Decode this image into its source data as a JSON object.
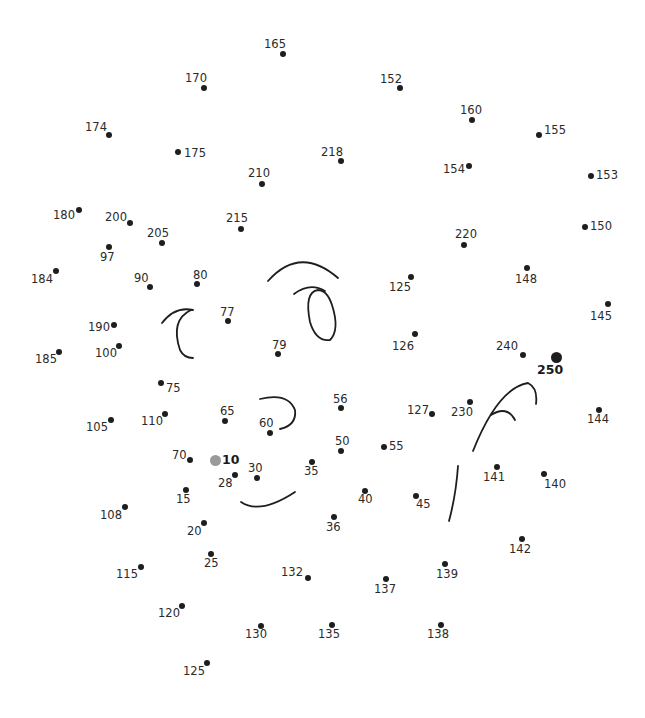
{
  "puzzle": {
    "type": "connect-the-dots",
    "start_number": "10",
    "end_number": "250",
    "colors": {
      "dot": "#1e1e1e",
      "start_dot": "#9a9a9a",
      "line": "#1e1e1e",
      "text": "#2a2a2a"
    },
    "dots": [
      {
        "n": "165",
        "x": 283,
        "y": 54,
        "lx": 264,
        "ly": 39
      },
      {
        "n": "170",
        "x": 204,
        "y": 88,
        "lx": 185,
        "ly": 73
      },
      {
        "n": "152",
        "x": 400,
        "y": 88,
        "lx": 380,
        "ly": 74
      },
      {
        "n": "160",
        "x": 472,
        "y": 120,
        "lx": 460,
        "ly": 105
      },
      {
        "n": "174",
        "x": 109,
        "y": 135,
        "lx": 85,
        "ly": 122
      },
      {
        "n": "155",
        "x": 539,
        "y": 135,
        "lx": 544,
        "ly": 125
      },
      {
        "n": "175",
        "x": 178,
        "y": 152,
        "lx": 184,
        "ly": 148
      },
      {
        "n": "218",
        "x": 341,
        "y": 161,
        "lx": 321,
        "ly": 147
      },
      {
        "n": "154",
        "x": 469,
        "y": 166,
        "lx": 443,
        "ly": 164
      },
      {
        "n": "153",
        "x": 591,
        "y": 176,
        "lx": 596,
        "ly": 170
      },
      {
        "n": "210",
        "x": 262,
        "y": 184,
        "lx": 248,
        "ly": 168
      },
      {
        "n": "180",
        "x": 79,
        "y": 210,
        "lx": 53,
        "ly": 210
      },
      {
        "n": "200",
        "x": 130,
        "y": 223,
        "lx": 105,
        "ly": 212
      },
      {
        "n": "215",
        "x": 241,
        "y": 229,
        "lx": 226,
        "ly": 213
      },
      {
        "n": "150",
        "x": 585,
        "y": 227,
        "lx": 590,
        "ly": 221
      },
      {
        "n": "205",
        "x": 162,
        "y": 243,
        "lx": 147,
        "ly": 228
      },
      {
        "n": "220",
        "x": 464,
        "y": 245,
        "lx": 455,
        "ly": 229
      },
      {
        "n": "97",
        "x": 109,
        "y": 247,
        "lx": 100,
        "ly": 252
      },
      {
        "n": "184",
        "x": 56,
        "y": 271,
        "lx": 31,
        "ly": 274
      },
      {
        "n": "125",
        "x": 411,
        "y": 277,
        "lx": 389,
        "ly": 282
      },
      {
        "n": "148",
        "x": 527,
        "y": 268,
        "lx": 515,
        "ly": 274
      },
      {
        "n": "90",
        "x": 150,
        "y": 287,
        "lx": 134,
        "ly": 273
      },
      {
        "n": "80",
        "x": 197,
        "y": 284,
        "lx": 193,
        "ly": 270
      },
      {
        "n": "145",
        "x": 608,
        "y": 304,
        "lx": 590,
        "ly": 311
      },
      {
        "n": "77",
        "x": 228,
        "y": 321,
        "lx": 220,
        "ly": 307
      },
      {
        "n": "190",
        "x": 114,
        "y": 325,
        "lx": 88,
        "ly": 322
      },
      {
        "n": "126",
        "x": 415,
        "y": 334,
        "lx": 392,
        "ly": 341
      },
      {
        "n": "100",
        "x": 119,
        "y": 346,
        "lx": 95,
        "ly": 348
      },
      {
        "n": "185",
        "x": 59,
        "y": 352,
        "lx": 35,
        "ly": 354
      },
      {
        "n": "79",
        "x": 278,
        "y": 354,
        "lx": 272,
        "ly": 340
      },
      {
        "n": "240",
        "x": 523,
        "y": 355,
        "lx": 496,
        "ly": 341
      },
      {
        "n": "250",
        "x": 556,
        "y": 357,
        "lx": 537,
        "ly": 364,
        "big": true
      },
      {
        "n": "75",
        "x": 161,
        "y": 383,
        "lx": 166,
        "ly": 383
      },
      {
        "n": "56",
        "x": 341,
        "y": 408,
        "lx": 333,
        "ly": 394
      },
      {
        "n": "127",
        "x": 432,
        "y": 414,
        "lx": 407,
        "ly": 405
      },
      {
        "n": "230",
        "x": 470,
        "y": 402,
        "lx": 451,
        "ly": 407
      },
      {
        "n": "144",
        "x": 599,
        "y": 410,
        "lx": 587,
        "ly": 414
      },
      {
        "n": "110",
        "x": 165,
        "y": 414,
        "lx": 141,
        "ly": 416
      },
      {
        "n": "65",
        "x": 225,
        "y": 421,
        "lx": 220,
        "ly": 406
      },
      {
        "n": "105",
        "x": 111,
        "y": 420,
        "lx": 86,
        "ly": 422
      },
      {
        "n": "60",
        "x": 270,
        "y": 433,
        "lx": 259,
        "ly": 418
      },
      {
        "n": "50",
        "x": 341,
        "y": 451,
        "lx": 335,
        "ly": 436
      },
      {
        "n": "55",
        "x": 384,
        "y": 447,
        "lx": 389,
        "ly": 441
      },
      {
        "n": "70",
        "x": 190,
        "y": 460,
        "lx": 172,
        "ly": 450
      },
      {
        "n": "10",
        "x": 215,
        "y": 460,
        "lx": 222,
        "ly": 454,
        "start": true
      },
      {
        "n": "35",
        "x": 312,
        "y": 462,
        "lx": 304,
        "ly": 466
      },
      {
        "n": "141",
        "x": 497,
        "y": 467,
        "lx": 483,
        "ly": 472
      },
      {
        "n": "28",
        "x": 235,
        "y": 475,
        "lx": 218,
        "ly": 478
      },
      {
        "n": "30",
        "x": 257,
        "y": 478,
        "lx": 248,
        "ly": 463
      },
      {
        "n": "140",
        "x": 544,
        "y": 474,
        "lx": 544,
        "ly": 479
      },
      {
        "n": "15",
        "x": 186,
        "y": 490,
        "lx": 176,
        "ly": 494
      },
      {
        "n": "40",
        "x": 365,
        "y": 491,
        "lx": 358,
        "ly": 494
      },
      {
        "n": "45",
        "x": 416,
        "y": 496,
        "lx": 416,
        "ly": 499
      },
      {
        "n": "108",
        "x": 125,
        "y": 507,
        "lx": 100,
        "ly": 510
      },
      {
        "n": "36",
        "x": 334,
        "y": 517,
        "lx": 326,
        "ly": 522
      },
      {
        "n": "20",
        "x": 204,
        "y": 523,
        "lx": 187,
        "ly": 526
      },
      {
        "n": "142",
        "x": 522,
        "y": 539,
        "lx": 509,
        "ly": 544
      },
      {
        "n": "25",
        "x": 211,
        "y": 554,
        "lx": 204,
        "ly": 558
      },
      {
        "n": "115",
        "x": 141,
        "y": 567,
        "lx": 116,
        "ly": 569
      },
      {
        "n": "139",
        "x": 445,
        "y": 564,
        "lx": 436,
        "ly": 569
      },
      {
        "n": "132",
        "x": 308,
        "y": 578,
        "lx": 281,
        "ly": 567
      },
      {
        "n": "137",
        "x": 386,
        "y": 579,
        "lx": 374,
        "ly": 584
      },
      {
        "n": "120",
        "x": 182,
        "y": 606,
        "lx": 158,
        "ly": 608
      },
      {
        "n": "130",
        "x": 261,
        "y": 626,
        "lx": 245,
        "ly": 629
      },
      {
        "n": "135",
        "x": 332,
        "y": 625,
        "lx": 318,
        "ly": 629
      },
      {
        "n": "138",
        "x": 441,
        "y": 625,
        "lx": 427,
        "ly": 629
      },
      {
        "n": "125",
        "x": 207,
        "y": 663,
        "lx": 183,
        "ly": 666
      }
    ],
    "curves": [
      {
        "name": "left-eye-arc",
        "d": "M 162 323 Q 175 306 193 310 M 191 310 Q 170 320 180 350 Q 184 358 193 358"
      },
      {
        "name": "right-eye-brow",
        "d": "M 268 281 Q 300 245 338 278"
      },
      {
        "name": "right-eye-oval",
        "d": "M 294 294 Q 310 282 325 291"
      },
      {
        "name": "right-eye-pupil",
        "d": "M 318 290 Q 304 292 310 322 Q 316 342 330 340 Q 340 330 332 305 Q 327 290 318 290"
      },
      {
        "name": "nose-curve",
        "d": "M 260 399 Q 288 392 295 410 Q 297 425 280 429"
      },
      {
        "name": "mouth-curve",
        "d": "M 241 502 Q 260 515 295 492"
      },
      {
        "name": "hand-arc",
        "d": "M 473 451 Q 498 388 528 383 Q 538 388 536 404"
      },
      {
        "name": "hand-finger",
        "d": "M 491 415 Q 507 405 515 420"
      },
      {
        "name": "body-line",
        "d": "M 458 466 Q 456 495 449 521"
      }
    ]
  }
}
